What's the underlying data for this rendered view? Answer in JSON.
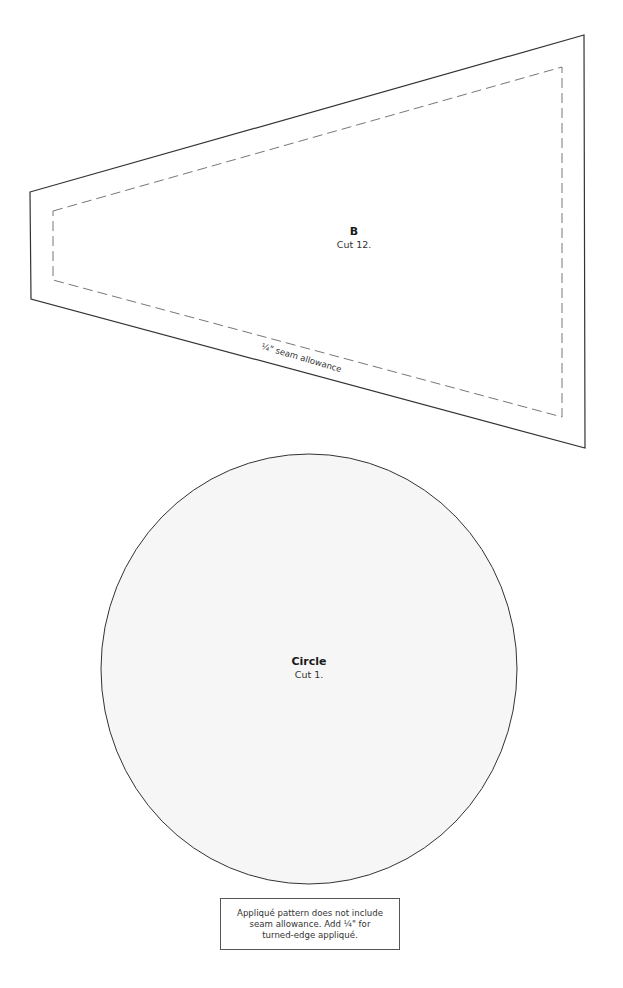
{
  "colors": {
    "outline": "#333333",
    "seam_line": "#777777",
    "circle_fill": "#f6f6f6",
    "background": "#ffffff"
  },
  "pattern_b": {
    "name": "B",
    "instruction": "Cut 12.",
    "seam_label": "¼\" seam allowance"
  },
  "pattern_circle": {
    "name": "Circle",
    "instruction": "Cut 1."
  },
  "note": {
    "lines": [
      "Appliqué pattern does not include",
      "seam allowance. Add ¼\" for",
      "turned-edge appliqué."
    ]
  }
}
